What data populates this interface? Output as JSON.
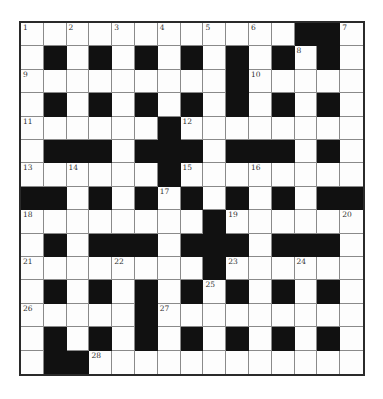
{
  "puzzle": {
    "rows": 15,
    "cols": 15,
    "grid": [
      "............##.",
      ".#.#.#.#.#.#.#.",
      ".........#.....",
      ".#.#.#.#.#.#.#.",
      "......#........",
      ".###.###.###.#.",
      "......#........",
      "##.#.#.#.#.#.##",
      "........#......",
      ".#.###.###.###.",
      "........#......",
      ".#.#.#.#.#.#.#.",
      ".....#.........",
      ".#.#.#.#.#.#.#.",
      ".##............"
    ],
    "numbers": [
      {
        "r": 0,
        "c": 0,
        "n": "1"
      },
      {
        "r": 0,
        "c": 2,
        "n": "2"
      },
      {
        "r": 0,
        "c": 4,
        "n": "3"
      },
      {
        "r": 0,
        "c": 6,
        "n": "4"
      },
      {
        "r": 0,
        "c": 8,
        "n": "5"
      },
      {
        "r": 0,
        "c": 10,
        "n": "6"
      },
      {
        "r": 0,
        "c": 14,
        "n": "7"
      },
      {
        "r": 1,
        "c": 12,
        "n": "8"
      },
      {
        "r": 2,
        "c": 0,
        "n": "9"
      },
      {
        "r": 2,
        "c": 10,
        "n": "10"
      },
      {
        "r": 4,
        "c": 0,
        "n": "11"
      },
      {
        "r": 4,
        "c": 7,
        "n": "12"
      },
      {
        "r": 6,
        "c": 0,
        "n": "13"
      },
      {
        "r": 6,
        "c": 2,
        "n": "14"
      },
      {
        "r": 6,
        "c": 7,
        "n": "15"
      },
      {
        "r": 6,
        "c": 10,
        "n": "16"
      },
      {
        "r": 7,
        "c": 6,
        "n": "17"
      },
      {
        "r": 8,
        "c": 0,
        "n": "18"
      },
      {
        "r": 8,
        "c": 9,
        "n": "19"
      },
      {
        "r": 8,
        "c": 14,
        "n": "20"
      },
      {
        "r": 10,
        "c": 0,
        "n": "21"
      },
      {
        "r": 10,
        "c": 4,
        "n": "22"
      },
      {
        "r": 10,
        "c": 9,
        "n": "23"
      },
      {
        "r": 10,
        "c": 12,
        "n": "24"
      },
      {
        "r": 11,
        "c": 8,
        "n": "25"
      },
      {
        "r": 12,
        "c": 0,
        "n": "26"
      },
      {
        "r": 12,
        "c": 6,
        "n": "27"
      },
      {
        "r": 14,
        "c": 3,
        "n": "28"
      }
    ],
    "colors": {
      "black_cell": "#111111",
      "white_cell": "#fdfdfd",
      "grid_line": "#8a8a8a",
      "border": "#2a2a2a"
    }
  }
}
